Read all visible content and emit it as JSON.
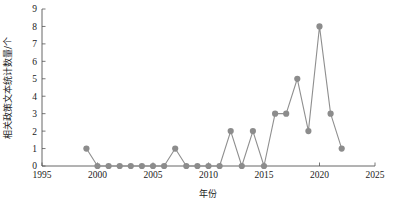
{
  "chart_data": {
    "type": "line",
    "title": "",
    "xlabel": "年份",
    "ylabel": "相关政策文本统计数量/个",
    "xlim": [
      1995,
      2025
    ],
    "ylim": [
      0,
      9
    ],
    "grid": false,
    "legend": null,
    "x_ticks": [
      1995,
      2000,
      2005,
      2010,
      2015,
      2020,
      2025
    ],
    "y_ticks": [
      0,
      1,
      2,
      3,
      4,
      5,
      6,
      7,
      8,
      9
    ],
    "x": [
      1999,
      2000,
      2001,
      2002,
      2003,
      2004,
      2005,
      2006,
      2007,
      2008,
      2009,
      2010,
      2011,
      2012,
      2013,
      2014,
      2015,
      2016,
      2017,
      2018,
      2019,
      2020,
      2021,
      2022
    ],
    "values": [
      1,
      0,
      0,
      0,
      0,
      0,
      0,
      0,
      1,
      0,
      0,
      0,
      0,
      2,
      0,
      2,
      0,
      3,
      3,
      5,
      2,
      8,
      3,
      1
    ],
    "series": [
      {
        "name": "相关政策文本统计数量",
        "values": [
          1,
          0,
          0,
          0,
          0,
          0,
          0,
          0,
          1,
          0,
          0,
          0,
          0,
          2,
          0,
          2,
          0,
          3,
          3,
          5,
          2,
          8,
          3,
          1
        ]
      }
    ],
    "marker_color": "#8c8c8c",
    "line_color": "#8f8f8f",
    "axis_color": "#555555"
  },
  "axes": {
    "x_tick_labels": [
      "1995",
      "2000",
      "2005",
      "2010",
      "2015",
      "2020",
      "2025"
    ],
    "y_tick_labels": [
      "0",
      "1",
      "2",
      "3",
      "4",
      "5",
      "6",
      "7",
      "8",
      "9"
    ],
    "x_axis_title": "年份",
    "y_axis_title": "相关政策文本统计数量/个"
  }
}
